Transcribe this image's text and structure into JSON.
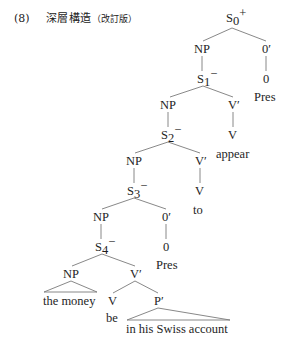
{
  "caption": {
    "number": "(8)",
    "title": "深層構造",
    "subtitle": "（改訂版）"
  },
  "tree": {
    "nodes": {
      "s0": {
        "label": "S",
        "sub": "0",
        "sup": "+"
      },
      "np1": {
        "label": "NP"
      },
      "zero_bar1": {
        "label": "0′"
      },
      "zero1": {
        "label": "0"
      },
      "pres1": {
        "label": "Pres"
      },
      "s1": {
        "label": "S",
        "sub": "1",
        "sup": "−"
      },
      "np2": {
        "label": "NP"
      },
      "vbar2": {
        "label": "V′"
      },
      "v2": {
        "label": "V"
      },
      "appear": {
        "label": "appear"
      },
      "s2": {
        "label": "S",
        "sub": "2",
        "sup": "−"
      },
      "np3": {
        "label": "NP"
      },
      "vbar3": {
        "label": "V′"
      },
      "v3": {
        "label": "V"
      },
      "to": {
        "label": "to"
      },
      "s3": {
        "label": "S",
        "sub": "3",
        "sup": "−"
      },
      "np4": {
        "label": "NP"
      },
      "zero_bar4": {
        "label": "0′"
      },
      "zero4": {
        "label": "0"
      },
      "pres4": {
        "label": "Pres"
      },
      "s4": {
        "label": "S",
        "sub": "4",
        "sup": "−"
      },
      "np5": {
        "label": "NP"
      },
      "vbar5": {
        "label": "V′"
      },
      "the_money": {
        "label": "the money"
      },
      "v5": {
        "label": "V"
      },
      "pbar": {
        "label": "P′"
      },
      "be": {
        "label": "be"
      },
      "pp_text": {
        "label": "in his Swiss account"
      }
    }
  }
}
